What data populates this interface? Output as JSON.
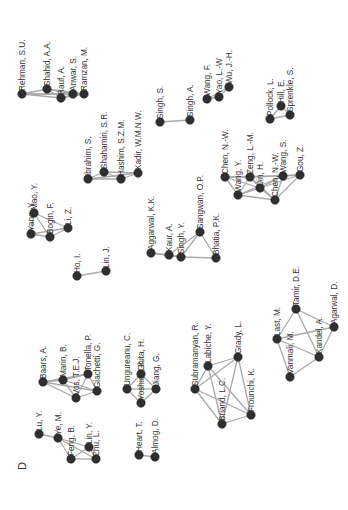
{
  "figure": {
    "panel_label": "D",
    "orientation": "rotated-90-ccw",
    "edge_color": "#a9a9a9",
    "node_color": "#2f2f2f",
    "label_color": "#333333"
  },
  "clusters": [
    {
      "id": "c1",
      "nodes": [
        {
          "id": "rehman",
          "label": "Rehman, S.U.",
          "x": 22,
          "y": 94
        },
        {
          "id": "shahid",
          "label": "Shahid, A.A.",
          "x": 47,
          "y": 89
        },
        {
          "id": "rauf",
          "label": "Rauf, A.",
          "x": 61,
          "y": 98
        },
        {
          "id": "anwar",
          "label": "Anwar, S.",
          "x": 73,
          "y": 94
        },
        {
          "id": "ramzan",
          "label": "Ramzan, M.",
          "x": 84,
          "y": 94
        }
      ],
      "edges": [
        [
          "rehman",
          "shahid"
        ],
        [
          "rehman",
          "rauf"
        ],
        [
          "rehman",
          "anwar"
        ],
        [
          "rehman",
          "ramzan"
        ],
        [
          "shahid",
          "rauf"
        ],
        [
          "shahid",
          "anwar"
        ],
        [
          "shahid",
          "ramzan"
        ],
        [
          "rauf",
          "anwar"
        ],
        [
          "rauf",
          "ramzan"
        ],
        [
          "anwar",
          "ramzan"
        ]
      ]
    },
    {
      "id": "c2",
      "nodes": [
        {
          "id": "ibrahim",
          "label": "Ibrahim, S.",
          "x": 88,
          "y": 179
        },
        {
          "id": "shahamiri",
          "label": "Shahamiri, S.R.",
          "x": 104,
          "y": 172
        },
        {
          "id": "hashim",
          "label": "Hashim, S.Z.M.",
          "x": 121,
          "y": 179
        },
        {
          "id": "kadir",
          "label": "Kadir, W.M.N.W.",
          "x": 138,
          "y": 173
        }
      ],
      "edges": [
        [
          "ibrahim",
          "shahamiri"
        ],
        [
          "ibrahim",
          "hashim"
        ],
        [
          "ibrahim",
          "kadir"
        ],
        [
          "shahamiri",
          "hashim"
        ],
        [
          "shahamiri",
          "kadir"
        ],
        [
          "hashim",
          "kadir"
        ]
      ]
    },
    {
      "id": "c3",
      "nodes": [
        {
          "id": "singhs",
          "label": "Singh, S.",
          "x": 160,
          "y": 122
        },
        {
          "id": "singha",
          "label": "Singh, A.",
          "x": 190,
          "y": 120
        }
      ],
      "edges": [
        [
          "singhs",
          "singha"
        ]
      ]
    },
    {
      "id": "c4",
      "nodes": [
        {
          "id": "wangf",
          "label": "Wang, F.",
          "x": 207,
          "y": 99
        },
        {
          "id": "yao",
          "label": "Yao, L.-W",
          "x": 219,
          "y": 97
        },
        {
          "id": "wuj",
          "label": "Wu, J.-H.",
          "x": 229,
          "y": 87
        }
      ],
      "edges": [
        [
          "wangf",
          "yao"
        ],
        [
          "wangf",
          "wuj"
        ],
        [
          "yao",
          "wuj"
        ]
      ]
    },
    {
      "id": "c5",
      "nodes": [
        {
          "id": "pollock",
          "label": "Pollock, L.",
          "x": 270,
          "y": 119
        },
        {
          "id": "hill",
          "label": "Hill, E.",
          "x": 281,
          "y": 106
        },
        {
          "id": "sprenkle",
          "label": "Sprenkle, S.",
          "x": 290,
          "y": 115
        }
      ],
      "edges": [
        [
          "pollock",
          "hill"
        ],
        [
          "pollock",
          "sprenkle"
        ],
        [
          "hill",
          "sprenkle"
        ]
      ]
    },
    {
      "id": "c6",
      "nodes": [
        {
          "id": "yang",
          "label": "Yang, Y.",
          "x": 31,
          "y": 234
        },
        {
          "id": "mao",
          "label": "Mao, Y.",
          "x": 34,
          "y": 213
        },
        {
          "id": "bogin",
          "label": "Bogin, F.",
          "x": 50,
          "y": 237
        },
        {
          "id": "liz",
          "label": "Li, Z.",
          "x": 68,
          "y": 228
        }
      ],
      "edges": [
        [
          "yang",
          "mao"
        ],
        [
          "yang",
          "bogin"
        ],
        [
          "yang",
          "liz"
        ],
        [
          "mao",
          "bogin"
        ],
        [
          "mao",
          "liz"
        ],
        [
          "bogin",
          "liz"
        ]
      ]
    },
    {
      "id": "c7",
      "nodes": [
        {
          "id": "ho",
          "label": "Ho, I.",
          "x": 77,
          "y": 276
        },
        {
          "id": "linj",
          "label": "Lin, J.",
          "x": 106,
          "y": 271
        }
      ],
      "edges": [
        [
          "ho",
          "linj"
        ]
      ]
    },
    {
      "id": "c8",
      "nodes": [
        {
          "id": "aggarwalk",
          "label": "Aggarwal, K.K.",
          "x": 151,
          "y": 253
        },
        {
          "id": "kaur",
          "label": "Kaur, A.",
          "x": 169,
          "y": 255
        },
        {
          "id": "singhy",
          "label": "Singh, Y.",
          "x": 181,
          "y": 257
        },
        {
          "id": "sangwan",
          "label": "Sangwan, O.P.",
          "x": 200,
          "y": 232
        },
        {
          "id": "bhatia",
          "label": "Bhatia, P.K.",
          "x": 216,
          "y": 258
        }
      ],
      "edges": [
        [
          "aggarwalk",
          "kaur"
        ],
        [
          "aggarwalk",
          "singhy"
        ],
        [
          "kaur",
          "singhy"
        ],
        [
          "kaur",
          "sangwan"
        ],
        [
          "singhy",
          "sangwan"
        ],
        [
          "singhy",
          "bhatia"
        ],
        [
          "sangwan",
          "bhatia"
        ]
      ]
    },
    {
      "id": "c9",
      "nodes": [
        {
          "id": "chenn1",
          "label": "Chen, N.-W.",
          "x": 225,
          "y": 177
        },
        {
          "id": "wangy",
          "label": "Wang, Y.",
          "x": 238,
          "y": 195
        },
        {
          "id": "zeng",
          "label": "Zeng, L.-M.",
          "x": 250,
          "y": 177
        },
        {
          "id": "jin",
          "label": "Jin, H.",
          "x": 260,
          "y": 188
        },
        {
          "id": "chenn2",
          "label": "Chen, N.-W.",
          "x": 275,
          "y": 200
        },
        {
          "id": "wangs",
          "label": "Wang, S.",
          "x": 283,
          "y": 176
        },
        {
          "id": "gou",
          "label": "Gou, Z.",
          "x": 300,
          "y": 175
        }
      ],
      "edges": [
        [
          "chenn1",
          "wangy"
        ],
        [
          "chenn1",
          "zeng"
        ],
        [
          "chenn1",
          "jin"
        ],
        [
          "chenn1",
          "wangs"
        ],
        [
          "wangy",
          "zeng"
        ],
        [
          "wangy",
          "jin"
        ],
        [
          "wangy",
          "chenn2"
        ],
        [
          "wangy",
          "wangs"
        ],
        [
          "wangy",
          "gou"
        ],
        [
          "zeng",
          "jin"
        ],
        [
          "zeng",
          "chenn2"
        ],
        [
          "zeng",
          "gou"
        ],
        [
          "jin",
          "chenn2"
        ],
        [
          "jin",
          "wangs"
        ],
        [
          "chenn2",
          "wangs"
        ],
        [
          "chenn2",
          "gou"
        ],
        [
          "wangs",
          "gou"
        ]
      ]
    },
    {
      "id": "c10",
      "nodes": [
        {
          "id": "luy",
          "label": "Lu, Y.",
          "x": 39,
          "y": 434
        },
        {
          "id": "yem",
          "label": "Ye, M.",
          "x": 58,
          "y": 438
        },
        {
          "id": "feng",
          "label": "Feng, B.",
          "x": 71,
          "y": 459
        },
        {
          "id": "liny",
          "label": "Lin, Y.",
          "x": 89,
          "y": 447
        },
        {
          "id": "zhu",
          "label": "Zhu, L.",
          "x": 96,
          "y": 459
        }
      ],
      "edges": [
        [
          "luy",
          "yem"
        ],
        [
          "yem",
          "feng"
        ],
        [
          "yem",
          "liny"
        ],
        [
          "yem",
          "zhu"
        ],
        [
          "feng",
          "liny"
        ],
        [
          "feng",
          "zhu"
        ],
        [
          "liny",
          "zhu"
        ]
      ]
    },
    {
      "id": "c11",
      "nodes": [
        {
          "id": "baars",
          "label": "Baars, A.",
          "x": 43,
          "y": 382
        },
        {
          "id": "marin",
          "label": "Marin, B.",
          "x": 63,
          "y": 380
        },
        {
          "id": "vos",
          "label": "Vos, T.E.J.",
          "x": 76,
          "y": 398
        },
        {
          "id": "tonella",
          "label": "Tonella, P.",
          "x": 88,
          "y": 374
        },
        {
          "id": "giachetti",
          "label": "Giachetti, G.",
          "x": 97,
          "y": 391
        }
      ],
      "edges": [
        [
          "baars",
          "marin"
        ],
        [
          "baars",
          "vos"
        ],
        [
          "baars",
          "tonella"
        ],
        [
          "baars",
          "giachetti"
        ],
        [
          "marin",
          "vos"
        ],
        [
          "marin",
          "tonella"
        ],
        [
          "marin",
          "giachetti"
        ],
        [
          "vos",
          "tonella"
        ],
        [
          "vos",
          "giachetti"
        ],
        [
          "tonella",
          "giachetti"
        ]
      ]
    },
    {
      "id": "c12",
      "nodes": [
        {
          "id": "ungureanu",
          "label": "Ungureanu, C.",
          "x": 127,
          "y": 389
        },
        {
          "id": "yoshida",
          "label": "Yoshida, K.",
          "x": 141,
          "y": 403
        },
        {
          "id": "ghita",
          "label": "Ghita, H.",
          "x": 141,
          "y": 374
        },
        {
          "id": "jiang",
          "label": "Jiang, G.",
          "x": 156,
          "y": 389
        }
      ],
      "edges": [
        [
          "ungureanu",
          "yoshida"
        ],
        [
          "ungureanu",
          "ghita"
        ],
        [
          "ungureanu",
          "jiang"
        ],
        [
          "yoshida",
          "ghita"
        ],
        [
          "yoshida",
          "jiang"
        ],
        [
          "ghita",
          "jiang"
        ]
      ]
    },
    {
      "id": "c13",
      "nodes": [
        {
          "id": "heart",
          "label": "Heart, T.",
          "x": 139,
          "y": 455
        },
        {
          "id": "almog",
          "label": "Almog, D.",
          "x": 155,
          "y": 457
        }
      ],
      "edges": [
        [
          "heart",
          "almog"
        ]
      ]
    },
    {
      "id": "c14",
      "nodes": [
        {
          "id": "subramanyan",
          "label": "Subramanyan, R.",
          "x": 195,
          "y": 389
        },
        {
          "id": "labiche",
          "label": "Labiche, Y.",
          "x": 208,
          "y": 366
        },
        {
          "id": "grady",
          "label": "Grady, L.",
          "x": 238,
          "y": 357
        },
        {
          "id": "briand",
          "label": "Briand, L.C.",
          "x": 222,
          "y": 424
        },
        {
          "id": "frounchi",
          "label": "Frounchi, K.",
          "x": 251,
          "y": 415
        }
      ],
      "edges": [
        [
          "subramanyan",
          "labiche"
        ],
        [
          "subramanyan",
          "grady"
        ],
        [
          "subramanyan",
          "briand"
        ],
        [
          "subramanyan",
          "frounchi"
        ],
        [
          "labiche",
          "grady"
        ],
        [
          "labiche",
          "briand"
        ],
        [
          "labiche",
          "frounchi"
        ],
        [
          "grady",
          "briand"
        ],
        [
          "grady",
          "frounchi"
        ],
        [
          "briand",
          "frounchi"
        ]
      ]
    },
    {
      "id": "c15",
      "nodes": [
        {
          "id": "last",
          "label": "Last, M.",
          "x": 277,
          "y": 339
        },
        {
          "id": "tamir",
          "label": "Tamir, D.E.",
          "x": 296,
          "y": 309
        },
        {
          "id": "vanmali",
          "label": "Vanmali, M.",
          "x": 290,
          "y": 377
        },
        {
          "id": "kandel",
          "label": "Kandel, A.",
          "x": 319,
          "y": 357
        },
        {
          "id": "agarwal",
          "label": "Agarwal, D.",
          "x": 334,
          "y": 327
        }
      ],
      "edges": [
        [
          "last",
          "tamir"
        ],
        [
          "last",
          "vanmali"
        ],
        [
          "last",
          "kandel"
        ],
        [
          "last",
          "agarwal"
        ],
        [
          "tamir",
          "kandel"
        ],
        [
          "tamir",
          "agarwal"
        ],
        [
          "vanmali",
          "kandel"
        ],
        [
          "kandel",
          "agarwal"
        ]
      ]
    }
  ]
}
